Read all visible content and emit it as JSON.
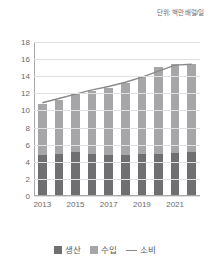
{
  "unit_note": "단위: 백만 배럴/일",
  "legend": {
    "position": "bottom",
    "items": [
      {
        "label": "생산",
        "marker": "square-swatch-dark",
        "color": "#6f6f71"
      },
      {
        "label": "수입",
        "marker": "square-swatch-light",
        "color": "#a6a6a8"
      },
      {
        "label": "소비",
        "marker": "line-swatch",
        "color": "#8a8a8c"
      }
    ]
  },
  "chart_data": {
    "type": "bar",
    "stacked": true,
    "title": "",
    "subtitle": "",
    "annotations": [
      "단위: 백만 배럴/일"
    ],
    "xlabel": "",
    "ylabel": "",
    "categories": [
      "2013",
      "2014",
      "2015",
      "2016",
      "2017",
      "2018",
      "2019",
      "2020",
      "2021",
      "2022"
    ],
    "tick_labels": [
      "2013",
      "",
      "2015",
      "",
      "2017",
      "",
      "2019",
      "",
      "2021",
      ""
    ],
    "visible_xticks": [
      "2013",
      "2015",
      "2017",
      "2019",
      "2021"
    ],
    "ylim": [
      0,
      18
    ],
    "yticks": [
      0,
      2,
      4,
      6,
      8,
      10,
      12,
      14,
      16,
      18
    ],
    "grid": true,
    "legend_position": "bottom",
    "series": [
      {
        "name": "생산",
        "type": "bar",
        "stack": "total",
        "color": "#6f6f71",
        "values": [
          4.8,
          4.9,
          5.1,
          4.9,
          4.85,
          4.85,
          4.9,
          4.9,
          5.0,
          5.2
        ]
      },
      {
        "name": "수입",
        "type": "bar",
        "stack": "total",
        "color": "#a6a6a8",
        "values": [
          5.9,
          6.3,
          6.9,
          7.4,
          7.75,
          8.35,
          9.1,
          10.2,
          10.4,
          10.2
        ]
      },
      {
        "name": "소비",
        "type": "line",
        "color": "#8a8a8c",
        "values": [
          10.9,
          11.4,
          11.9,
          12.4,
          12.8,
          13.3,
          13.9,
          14.6,
          15.3,
          15.4
        ]
      }
    ],
    "totals": [
      10.7,
      11.2,
      12.0,
      12.3,
      12.6,
      13.2,
      14.0,
      15.1,
      15.8,
      15.4
    ]
  }
}
